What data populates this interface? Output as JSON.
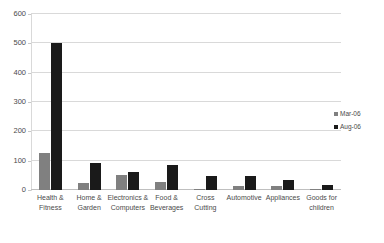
{
  "chart_data": {
    "type": "bar",
    "title": "",
    "xlabel": "",
    "ylabel": "",
    "ylim": [
      0,
      600
    ],
    "yticks": [
      0,
      100,
      200,
      300,
      400,
      500,
      600
    ],
    "ytick_labels": [
      "0",
      "100",
      "200",
      "300",
      "400",
      "500",
      "600"
    ],
    "grid": true,
    "legend_position": "right",
    "categories": [
      "Health &\nFitness",
      "Home &\nGarden",
      "Electronics &\nComputers",
      "Food &\nBeverages",
      "Cross\nCutting",
      "Automotive",
      "Appliances",
      "Goods for\nchildren"
    ],
    "series": [
      {
        "name": "Mar-06",
        "color": "#808080",
        "values": [
          125,
          25,
          52,
          27,
          3,
          13,
          12,
          2
        ]
      },
      {
        "name": "Aug-06",
        "color": "#1a1a1a",
        "values": [
          500,
          93,
          60,
          85,
          48,
          47,
          33,
          18
        ]
      }
    ]
  },
  "legend": {
    "items": [
      {
        "label": "Mar-06",
        "color": "#808080"
      },
      {
        "label": "Aug-06",
        "color": "#1a1a1a"
      }
    ]
  },
  "colors": {
    "series_mar": "#808080",
    "series_aug": "#1a1a1a",
    "gridline": "#d9d9d9",
    "axis_text": "#4a4a4a",
    "background": "#ffffff"
  }
}
